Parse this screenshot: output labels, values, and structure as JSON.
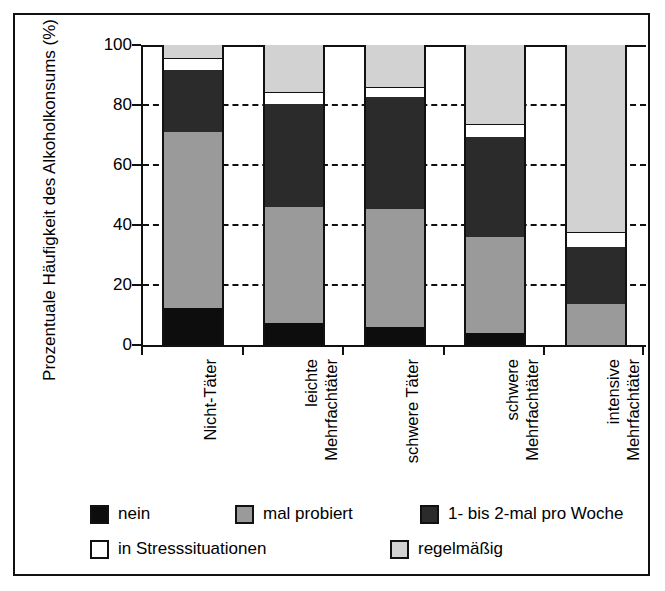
{
  "chart_data": {
    "type": "bar",
    "subtype": "stacked-bar-100",
    "title": "",
    "xlabel": "",
    "ylabel": "Prozentuale Häufigkeit des Alkoholkonsums (%)",
    "ylim": [
      0,
      100
    ],
    "yticks": [
      0,
      20,
      40,
      60,
      80,
      100
    ],
    "ytick_labels": [
      "0",
      "20",
      "40",
      "60",
      "80",
      "100"
    ],
    "grid": "horizontal-dashed",
    "legend_position": "bottom",
    "categories": [
      {
        "line1": "Nicht-Täter",
        "line2": ""
      },
      {
        "line1": "leichte",
        "line2": "Mehrfachtäter"
      },
      {
        "line1": "schwere Täter",
        "line2": ""
      },
      {
        "line1": "schwere",
        "line2": "Mehrfachtäter"
      },
      {
        "line1": "intensive",
        "line2": "Mehrfachtäter"
      }
    ],
    "series": [
      {
        "name": "nein",
        "color": "#0d0d0d",
        "values": [
          12.5,
          7.5,
          6.0,
          4.0,
          0.0
        ]
      },
      {
        "name": "mal probiert",
        "color": "#9a9a9a",
        "values": [
          58.5,
          38.5,
          39.3,
          32.0,
          13.7
        ]
      },
      {
        "name": "1- bis 2-mal pro Woche",
        "color": "#2b2b2b",
        "values": [
          20.7,
          34.5,
          37.3,
          33.3,
          19.0
        ]
      },
      {
        "name": "in Stresssituationen",
        "color": "#ffffff",
        "values": [
          4.0,
          4.0,
          3.3,
          4.4,
          5.0
        ]
      },
      {
        "name": "regelmäßig",
        "color": "#d2d2d2",
        "values": [
          4.3,
          15.5,
          14.1,
          26.3,
          62.3
        ]
      }
    ],
    "legend_rows": [
      [
        "nein",
        "mal probiert",
        "1- bis 2-mal pro Woche"
      ],
      [
        "in Stresssituationen",
        "regelmäßig"
      ]
    ],
    "axis_color": "#111111",
    "background": "#ffffff"
  }
}
